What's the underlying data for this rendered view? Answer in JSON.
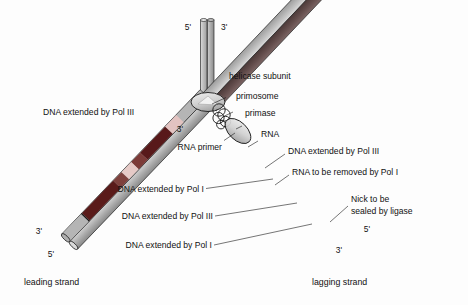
{
  "figure": {
    "title_absent": "",
    "background_color": "#fdfdfd",
    "colors": {
      "template_strand_gray": "#b9b9b9",
      "template_strand_gray_dark": "#8f8f8f",
      "parental_left_gray": "#c2c2c2",
      "parental_right_gray": "#9a9a9a",
      "new_dna_pol3": "#5b1a1a",
      "new_dna_pol1": "#7a3a38",
      "rna_primer": "#e3c3c1",
      "leading_new_strand": "#6b5352",
      "outline": "#1a1a1a",
      "protein_fill": "#d8d8d8",
      "text": "#111111"
    }
  },
  "primes": {
    "top_left": "5'",
    "top_right": "3'",
    "fork_leading_template": "3'",
    "leading_end_upper": "3'",
    "leading_end_lower": "5'",
    "lagging_end_upper": "5'",
    "lagging_end_lower": "3'"
  },
  "labels": {
    "helicase": "helicase subunit",
    "primosome": "primosome",
    "primase": "primase",
    "rna": "RNA",
    "rna_primer": "RNA primer",
    "leading_pol3": "DNA extended by Pol III",
    "lagging_pol3_right": "DNA extended by Pol III",
    "rna_removed": "RNA to be removed by Pol I",
    "lagging_pol1_a": "DNA extended by Pol I",
    "lagging_pol3_b": "DNA extended by Pol III",
    "lagging_pol1_b": "DNA extended by Pol I",
    "nick_line1": "Nick to be",
    "nick_line2": "sealed by ligase",
    "leading_strand": "leading strand",
    "lagging_strand": "lagging strand"
  },
  "diagram_data": {
    "type": "replication-fork-schematic",
    "parental_duplex": {
      "orientation": "vertical",
      "top_y": 18,
      "fork_y": 98,
      "x": 207,
      "strands": 2
    },
    "leading_arm": {
      "from": [
        202,
        100
      ],
      "to": [
        48,
        248
      ],
      "template_color": "#b9b9b9",
      "new_strand_color": "#6b5352",
      "continuous": true
    },
    "lagging_arm": {
      "from": [
        213,
        100
      ],
      "to": [
        362,
        243
      ],
      "template_color": "#b9b9b9",
      "fragments": [
        {
          "kind": "rna",
          "label": "RNA",
          "color": "#e3c3c1"
        },
        {
          "kind": "dna_pol3",
          "label": "DNA extended by Pol III",
          "color": "#5b1a1a"
        },
        {
          "kind": "dna_pol1",
          "label": "DNA extended by Pol I",
          "color": "#7a3a38"
        },
        {
          "kind": "rna",
          "label": "RNA to be removed by Pol I",
          "color": "#e3c3c1"
        },
        {
          "kind": "dna_pol1",
          "label": "DNA extended by Pol I",
          "color": "#7a3a38"
        },
        {
          "kind": "dna_pol3",
          "label": "DNA extended by Pol III",
          "color": "#5b1a1a"
        },
        {
          "kind": "nick",
          "label": "Nick to be sealed by ligase",
          "color": "#1a1a1a"
        }
      ]
    },
    "proteins": [
      {
        "name": "helicase subunit",
        "shape": "ellipse",
        "cx": 208,
        "cy": 102
      },
      {
        "name": "primosome",
        "shape": "cluster-of-circles",
        "cx": 222,
        "cy": 114
      },
      {
        "name": "primase",
        "shape": "ellipse",
        "cx": 237,
        "cy": 128
      }
    ]
  }
}
